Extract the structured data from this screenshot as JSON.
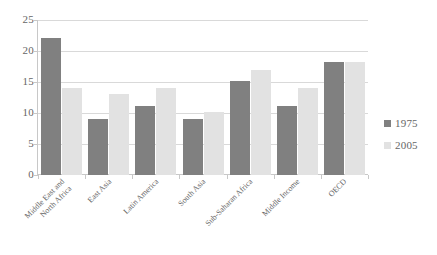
{
  "chart_data": {
    "type": "bar",
    "title": "",
    "subtitle": "",
    "xlabel": "",
    "ylabel": "",
    "ylim": [
      0,
      25
    ],
    "ytick_step": 5,
    "ytick_labels": [
      "0",
      "5",
      "10",
      "15",
      "20",
      "25"
    ],
    "grid": true,
    "legend_position": "right",
    "categories": [
      "Middle East and North Africa",
      "East Asia",
      "Latin America",
      "South Asia",
      "Sub-Saharan Africa",
      "Middle Income",
      "OECD"
    ],
    "category_label_lines": [
      [
        "Middle East and",
        "North Africa"
      ],
      [
        "East Asia"
      ],
      [
        "Latin America"
      ],
      [
        "South Asia"
      ],
      [
        "Sub-Saharan Africa"
      ],
      [
        "Middle Income"
      ],
      [
        "OECD"
      ]
    ],
    "series": [
      {
        "name": "1975",
        "color": "#808080",
        "values": [
          22.1,
          9.1,
          11.1,
          9.1,
          15.1,
          11.1,
          18.2
        ]
      },
      {
        "name": "2005",
        "color": "#e2e2e2",
        "values": [
          14.0,
          13.0,
          14.0,
          10.1,
          17.0,
          14.0,
          18.2
        ]
      }
    ]
  },
  "legend": {
    "items": [
      {
        "label": "1975",
        "color": "#808080"
      },
      {
        "label": "2005",
        "color": "#e2e2e2"
      }
    ]
  },
  "colors": {
    "series_1975": "#808080",
    "series_2005": "#e2e2e2",
    "gridline": "#d9d9d9",
    "axis": "#c8c8c8",
    "text": "#666666",
    "background": "#ffffff"
  }
}
